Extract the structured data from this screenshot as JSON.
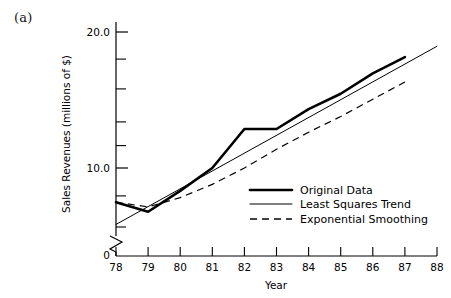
{
  "figure": {
    "panel_label": "(a)",
    "background_color": "#ffffff",
    "ink_color": "#000000"
  },
  "chart_data": {
    "type": "line",
    "title": "",
    "subtitle": "",
    "panel": "(a)",
    "xlabel": "Year",
    "ylabel": "Sales Revenues (millions of $)",
    "yscale": "log",
    "grid": false,
    "ylim": [
      6.0,
      21.5
    ],
    "xlim": [
      78,
      88
    ],
    "y_major_ticks": [
      10.0,
      20.0
    ],
    "y_major_tick_labels": [
      "10.0",
      "20.0"
    ],
    "y_minor_ticks": [
      7.0,
      8.0,
      9.0,
      12.0,
      14.0,
      16.0,
      18.0
    ],
    "axis_break_symbol": true,
    "zero_label": "0",
    "x": [
      78,
      79,
      80,
      81,
      82,
      83,
      84,
      85,
      86,
      87,
      88
    ],
    "xtick_labels": [
      "78",
      "79",
      "80",
      "81",
      "82",
      "83",
      "84",
      "85",
      "86",
      "87",
      "88"
    ],
    "legend_position": "center-right",
    "series": [
      {
        "name": "Original Data",
        "style": "solid-thick",
        "linewidth": 2.6,
        "x": [
          78,
          79,
          80,
          81,
          82,
          83,
          84,
          85,
          86,
          87
        ],
        "values": [
          8.4,
          8.0,
          8.9,
          10.0,
          12.2,
          12.2,
          13.5,
          14.6,
          16.2,
          17.6
        ]
      },
      {
        "name": "Least Squares Trend",
        "style": "solid-thin",
        "linewidth": 1.0,
        "x": [
          78,
          88
        ],
        "values": [
          7.5,
          18.6
        ]
      },
      {
        "name": "Exponential Smoothing",
        "style": "dashed",
        "linewidth": 1.2,
        "x": [
          78,
          79,
          80,
          81,
          82,
          83,
          84,
          85,
          86,
          87
        ],
        "values": [
          8.4,
          8.2,
          8.6,
          9.2,
          10.0,
          11.0,
          12.0,
          13.0,
          14.2,
          15.5
        ]
      }
    ],
    "legend_entries": [
      {
        "label": "Original Data",
        "style": "solid-thick"
      },
      {
        "label": "Least Squares Trend",
        "style": "solid-thin"
      },
      {
        "label": "Exponential Smoothing",
        "style": "dashed"
      }
    ]
  }
}
